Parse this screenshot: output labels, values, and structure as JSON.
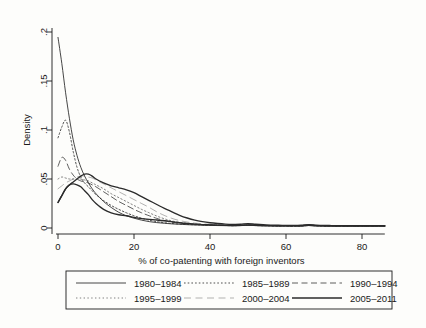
{
  "chart_data": {
    "type": "line",
    "title": "",
    "xlabel": "% of co-patenting with foreign inventors",
    "ylabel": "Density",
    "xlim": [
      -2,
      88
    ],
    "ylim": [
      0,
      0.205
    ],
    "xticks": [
      0,
      20,
      40,
      60,
      80
    ],
    "xtick_labels": [
      "0",
      "20",
      "40",
      "60",
      "80"
    ],
    "yticks": [
      0,
      0.05,
      0.1,
      0.15,
      0.2
    ],
    "ytick_labels": [
      "0",
      ".05",
      ".1",
      ".15",
      ".2"
    ],
    "grid": false,
    "legend_position": "below-outside",
    "x": [
      0,
      1,
      2,
      3,
      4,
      5,
      6,
      7,
      8,
      9,
      10,
      12,
      14,
      16,
      18,
      20,
      22,
      24,
      26,
      28,
      30,
      32,
      34,
      36,
      38,
      40,
      42,
      44,
      46,
      48,
      50,
      52,
      54,
      56,
      58,
      60,
      62,
      64,
      66,
      68,
      70,
      72,
      74,
      76,
      78,
      80,
      82,
      84,
      86
    ],
    "series": [
      {
        "name": "1980-1984",
        "style": "solid-thin",
        "values": [
          0.1945,
          0.168,
          0.138,
          0.112,
          0.09,
          0.074,
          0.062,
          0.053,
          0.046,
          0.04,
          0.035,
          0.027,
          0.021,
          0.016,
          0.0125,
          0.01,
          0.008,
          0.0065,
          0.0055,
          0.0048,
          0.0042,
          0.0038,
          0.0034,
          0.0031,
          0.0029,
          0.0027,
          0.0025,
          0.0024,
          0.0023,
          0.0024,
          0.0028,
          0.0024,
          0.0022,
          0.0021,
          0.002,
          0.002,
          0.0019,
          0.002,
          0.0025,
          0.0021,
          0.0019,
          0.0019,
          0.0018,
          0.0018,
          0.0018,
          0.0018,
          0.0018,
          0.0018,
          0.0018
        ]
      },
      {
        "name": "1985-1989",
        "style": "dotted",
        "values": [
          0.092,
          0.103,
          0.11,
          0.098,
          0.078,
          0.062,
          0.052,
          0.046,
          0.042,
          0.038,
          0.034,
          0.028,
          0.023,
          0.019,
          0.0155,
          0.0125,
          0.01,
          0.008,
          0.0065,
          0.0054,
          0.0046,
          0.004,
          0.0036,
          0.0033,
          0.003,
          0.0028,
          0.0026,
          0.0025,
          0.0024,
          0.0025,
          0.0029,
          0.0025,
          0.0023,
          0.0022,
          0.0021,
          0.0021,
          0.002,
          0.0021,
          0.0026,
          0.0022,
          0.002,
          0.002,
          0.0019,
          0.0019,
          0.0019,
          0.0019,
          0.0019,
          0.0019,
          0.0019
        ]
      },
      {
        "name": "1990-1994",
        "style": "dashed-long",
        "values": [
          0.063,
          0.072,
          0.069,
          0.06,
          0.054,
          0.05,
          0.048,
          0.047,
          0.046,
          0.044,
          0.042,
          0.037,
          0.032,
          0.027,
          0.023,
          0.019,
          0.0155,
          0.0125,
          0.0098,
          0.0076,
          0.006,
          0.005,
          0.0043,
          0.0038,
          0.0034,
          0.0031,
          0.0029,
          0.0027,
          0.0026,
          0.0027,
          0.0031,
          0.0027,
          0.0025,
          0.0023,
          0.0022,
          0.0022,
          0.0021,
          0.0022,
          0.0027,
          0.0023,
          0.0021,
          0.0021,
          0.002,
          0.002,
          0.002,
          0.002,
          0.002,
          0.002,
          0.002
        ]
      },
      {
        "name": "1995-1999",
        "style": "dotted-light",
        "values": [
          0.05,
          0.052,
          0.051,
          0.05,
          0.05,
          0.05,
          0.05,
          0.049,
          0.048,
          0.046,
          0.044,
          0.04,
          0.035,
          0.031,
          0.027,
          0.023,
          0.019,
          0.0155,
          0.0122,
          0.0094,
          0.0072,
          0.0058,
          0.0048,
          0.0041,
          0.0036,
          0.0033,
          0.003,
          0.0028,
          0.0027,
          0.0028,
          0.0032,
          0.0028,
          0.0026,
          0.0024,
          0.0023,
          0.0023,
          0.0022,
          0.0023,
          0.0028,
          0.0024,
          0.0022,
          0.0022,
          0.0021,
          0.0021,
          0.0021,
          0.0021,
          0.0021,
          0.0021,
          0.0021
        ]
      },
      {
        "name": "2000-2004",
        "style": "dashed-faint",
        "values": [
          0.04,
          0.043,
          0.046,
          0.048,
          0.05,
          0.052,
          0.053,
          0.053,
          0.052,
          0.051,
          0.049,
          0.045,
          0.041,
          0.037,
          0.033,
          0.029,
          0.025,
          0.021,
          0.0165,
          0.0128,
          0.0098,
          0.0076,
          0.0061,
          0.005,
          0.0043,
          0.0038,
          0.0034,
          0.0031,
          0.0029,
          0.003,
          0.0034,
          0.003,
          0.0027,
          0.0026,
          0.0025,
          0.0024,
          0.0024,
          0.0025,
          0.003,
          0.0026,
          0.0024,
          0.0023,
          0.0022,
          0.0022,
          0.0022,
          0.0022,
          0.0022,
          0.0022,
          0.0022
        ]
      },
      {
        "name": "2005-2011",
        "style": "solid-thick",
        "values": [
          0.026,
          0.033,
          0.04,
          0.044,
          0.047,
          0.05,
          0.053,
          0.055,
          0.055,
          0.053,
          0.05,
          0.046,
          0.043,
          0.041,
          0.039,
          0.036,
          0.032,
          0.028,
          0.024,
          0.02,
          0.0165,
          0.013,
          0.0102,
          0.008,
          0.0065,
          0.0054,
          0.0046,
          0.004,
          0.0037,
          0.0038,
          0.0045,
          0.0038,
          0.0033,
          0.003,
          0.0028,
          0.0027,
          0.0026,
          0.0028,
          0.0035,
          0.0029,
          0.0026,
          0.0025,
          0.0024,
          0.0024,
          0.0024,
          0.0024,
          0.0024,
          0.0024,
          0.0024
        ]
      },
      {
        "name": "2005-2011-low",
        "style": "solid-thick",
        "values": [
          0.026,
          0.033,
          0.04,
          0.044,
          0.045,
          0.044,
          0.042,
          0.038,
          0.034,
          0.029,
          0.025,
          0.019,
          0.0155,
          0.0135,
          0.0125,
          0.0108,
          0.0095,
          0.0088,
          0.0082,
          0.0074,
          0.0064,
          0.0054,
          0.0046,
          0.004,
          0.0035,
          0.0032,
          0.0029,
          0.0027,
          0.0026,
          0.0027,
          0.0031,
          0.0027,
          0.0025,
          0.0024,
          0.0023,
          0.0023,
          0.0022,
          0.0023,
          0.0028,
          0.0024,
          0.0022,
          0.0022,
          0.0021,
          0.0021,
          0.0021,
          0.0021,
          0.0021,
          0.0021,
          0.0021
        ]
      }
    ],
    "legend_entries": [
      {
        "label": "1980-1984",
        "style": "solid-thin"
      },
      {
        "label": "1985-1989",
        "style": "dotted"
      },
      {
        "label": "1990-1994",
        "style": "dashed-long"
      },
      {
        "label": "1995-1999",
        "style": "dotted-light"
      },
      {
        "label": "2000-2004",
        "style": "dashed-faint"
      },
      {
        "label": "2005-2011",
        "style": "solid-thick"
      }
    ]
  },
  "colors": {
    "line": "#2b2b2b",
    "axis": "#1a1a1a",
    "background": "#fdfdfb"
  }
}
